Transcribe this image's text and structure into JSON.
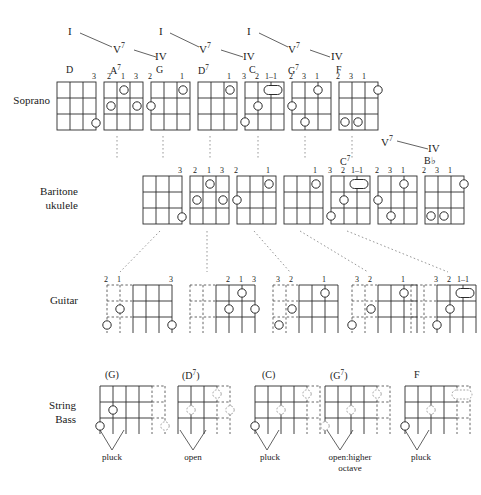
{
  "figure": {
    "rows": [
      {
        "id": "soprano",
        "label": "Soprano"
      },
      {
        "id": "baritone",
        "label": "Baritone\nukulele"
      },
      {
        "id": "guitar",
        "label": "Guitar"
      },
      {
        "id": "bass",
        "label": "String\nBass"
      }
    ]
  },
  "progression_top": {
    "groups": [
      {
        "i": "I",
        "v7": "V7",
        "iv": "IV"
      },
      {
        "i": "I",
        "v7": "V7",
        "iv": "IV"
      },
      {
        "i": "I",
        "v7": "V7",
        "iv": "IV"
      }
    ]
  },
  "progression_right": {
    "v7": "V7",
    "iv": "IV"
  },
  "soprano": {
    "label": "Soprano",
    "chords": [
      {
        "name": "D",
        "fingers": [
          "",
          "",
          "",
          "3"
        ]
      },
      {
        "name": "A7",
        "fingers": [
          "2",
          "1",
          "3",
          ""
        ]
      },
      {
        "name": "G",
        "fingers": [
          "2",
          "",
          "",
          "1"
        ]
      },
      {
        "name": "D7",
        "fingers": [
          "",
          "",
          "",
          "1"
        ]
      },
      {
        "name": "C",
        "fingers": [
          "",
          "3",
          "2",
          "1–1"
        ]
      },
      {
        "name": "G7",
        "fingers": [
          "2",
          "3",
          "1",
          ""
        ]
      },
      {
        "name": "F",
        "fingers": [
          "2",
          "3",
          "1",
          ""
        ]
      }
    ]
  },
  "baritone": {
    "label_line1": "Baritone",
    "label_line2": "ukulele",
    "chords": [
      {
        "name": "",
        "fingers": [
          "",
          "",
          "",
          "3"
        ]
      },
      {
        "name": "",
        "fingers": [
          "2",
          "1",
          "3",
          ""
        ]
      },
      {
        "name": "",
        "fingers": [
          "2",
          "",
          "",
          "1"
        ]
      },
      {
        "name": "",
        "fingers": [
          "",
          "",
          "",
          "1"
        ]
      },
      {
        "name": "",
        "fingers": [
          "3",
          "2",
          "1–1",
          ""
        ]
      },
      {
        "name": "C7",
        "fingers": [
          "2",
          "3",
          "1",
          ""
        ]
      },
      {
        "name": "B♭",
        "fingers": [
          "2",
          "3",
          "1",
          ""
        ]
      }
    ]
  },
  "guitar": {
    "label": "Guitar",
    "chords": [
      {
        "fingers": [
          "2",
          "1",
          "",
          "3"
        ]
      },
      {
        "fingers": [
          "",
          "2",
          "1",
          "3"
        ]
      },
      {
        "fingers": [
          "3",
          "2",
          "",
          "1"
        ]
      },
      {
        "fingers": [
          "3",
          "2",
          "",
          "1"
        ]
      },
      {
        "fingers": [
          "3",
          "2",
          "1–1",
          ""
        ]
      }
    ]
  },
  "bass": {
    "label_line1": "String",
    "label_line2": "Bass",
    "chords": [
      {
        "name": "(G)",
        "note": "pluck"
      },
      {
        "name": "(D7)",
        "note": "open"
      },
      {
        "name": "(C)",
        "note": "pluck"
      },
      {
        "name": "(G7)",
        "note": "open:higher\noctave"
      },
      {
        "name": "F",
        "note": "pluck"
      }
    ]
  },
  "colors": {
    "ink": "#1a1a1a",
    "line": "#2b2b2b",
    "dashed": "#6f6f6f",
    "ghost": "#8a8a8a",
    "paper": "#ffffff"
  }
}
